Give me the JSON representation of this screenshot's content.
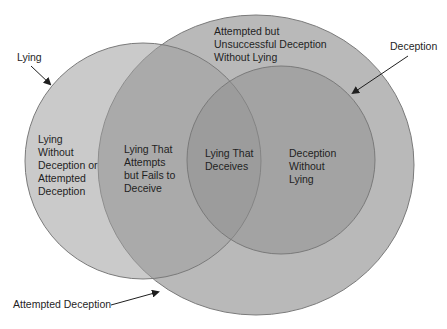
{
  "diagram": {
    "type": "venn",
    "colors": {
      "background": "#ffffff",
      "attempted_deception_fill": "#b8b8b8",
      "lying_fill": "#a8a8a8",
      "deception_fill": "#a0a0a0",
      "outline": "#7a7a7a",
      "arrow": "#1f1f1f",
      "text": "#1f1f1f"
    },
    "sets": [
      {
        "id": "attempted-deception",
        "label": "Attempted Deception"
      },
      {
        "id": "lying",
        "label": "Lying"
      },
      {
        "id": "deception",
        "label": "Deception"
      }
    ],
    "regions": {
      "lying_only": "Lying\nWithout\nDeception or\nAttempted\nDeception",
      "lying_attempts_fails": "Lying That\nAttempts\nbut Fails to\nDeceive",
      "lying_deceives": "Lying That\nDeceives",
      "deception_without_lying": "Deception\nWithout\nLying",
      "attempted_unsuccessful": "Attempted but\nUnsuccessful Deception\nWithout Lying"
    },
    "callouts": {
      "lying": "Lying",
      "deception": "Deception",
      "attempted_deception": "Attempted Deception"
    }
  }
}
